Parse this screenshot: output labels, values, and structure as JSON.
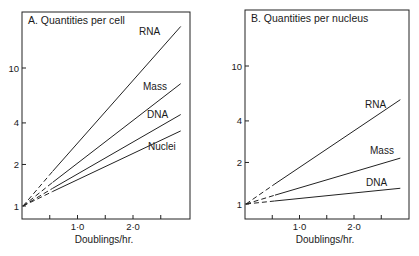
{
  "chart_data": [
    {
      "type": "line",
      "title": "A.  Quantities per cell",
      "xlabel": "Doublings/hr.",
      "ylabel": "",
      "yscale": "log",
      "ylim": [
        0.9,
        24
      ],
      "xlim": [
        0,
        3.0
      ],
      "y_ticks": [
        1,
        2,
        4,
        10
      ],
      "y_tick_labels": [
        "1",
        "2",
        "4",
        "10"
      ],
      "x_ticks": [
        0.5,
        1.0,
        1.5,
        2.0,
        2.5
      ],
      "x_tick_labels": [
        "",
        "1·0",
        "",
        "2·0",
        ""
      ],
      "grid": false,
      "dashed_below_x": 0.55,
      "series": [
        {
          "name": "RNA",
          "x": [
            0,
            2.86
          ],
          "values": [
            1,
            20
          ]
        },
        {
          "name": "Mass",
          "x": [
            0,
            2.86
          ],
          "values": [
            1,
            7.7
          ]
        },
        {
          "name": "DNA",
          "x": [
            0,
            2.86
          ],
          "values": [
            1,
            4.6
          ]
        },
        {
          "name": "Nuclei",
          "x": [
            0,
            2.86
          ],
          "values": [
            1,
            3.5
          ]
        }
      ]
    },
    {
      "type": "line",
      "title": "B.  Quantities per nucleus",
      "xlabel": "Doublings/hr.",
      "ylabel": "",
      "yscale": "log",
      "ylim": [
        0.9,
        24
      ],
      "xlim": [
        0,
        3.0
      ],
      "y_ticks": [
        1,
        2,
        4,
        10
      ],
      "y_tick_labels": [
        "1",
        "2",
        "4",
        "10"
      ],
      "x_ticks": [
        0.5,
        1.0,
        1.5,
        2.0,
        2.5
      ],
      "x_tick_labels": [
        "",
        "1·0",
        "",
        "2·0",
        ""
      ],
      "grid": false,
      "dashed_below_x": 0.55,
      "series": [
        {
          "name": "RNA",
          "x": [
            0,
            2.85
          ],
          "values": [
            1,
            5.7
          ]
        },
        {
          "name": "Mass",
          "x": [
            0,
            2.85
          ],
          "values": [
            1,
            2.15
          ]
        },
        {
          "name": "DNA",
          "x": [
            0,
            2.85
          ],
          "values": [
            1,
            1.3
          ]
        }
      ]
    }
  ],
  "panels": [
    {
      "title": "A.  Quantities per cell",
      "xlabel": "Doublings/hr.",
      "labels": [
        "RNA",
        "Mass",
        "DNA",
        "Nuclei"
      ]
    },
    {
      "title": "B.  Quantities per nucleus",
      "xlabel": "Doublings/hr.",
      "labels": [
        "RNA",
        "Mass",
        "DNA"
      ]
    }
  ]
}
